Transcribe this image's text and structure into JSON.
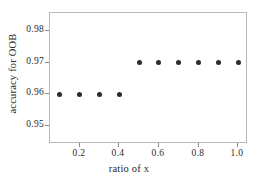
{
  "chart_data": {
    "type": "scatter",
    "title": "",
    "xlabel": "ratio of x",
    "ylabel": "accuracy for OOB",
    "xlim": [
      0.05,
      1.05
    ],
    "ylim": [
      0.9445,
      0.9855
    ],
    "grid": false,
    "legend": null,
    "marker": {
      "shape": "circle",
      "color": "#2b2b2b",
      "size": 5
    },
    "x": [
      0.1,
      0.2,
      0.3,
      0.4,
      0.5,
      0.6,
      0.7,
      0.8,
      0.9,
      1.0
    ],
    "values": [
      0.96,
      0.96,
      0.96,
      0.96,
      0.97,
      0.97,
      0.97,
      0.97,
      0.97,
      0.97
    ],
    "xticks": [
      0.2,
      0.4,
      0.6,
      0.8,
      1.0
    ],
    "xticklabels": [
      "0.2",
      "0.4",
      "0.6",
      "0.8",
      "1.0"
    ],
    "yticks": [
      0.95,
      0.96,
      0.97,
      0.98
    ],
    "yticklabels": [
      "0.95",
      "0.96",
      "0.97",
      "0.98"
    ]
  },
  "figure": {
    "background_color": "#ffffff",
    "frame_color": "#b9b9b9",
    "tick_color": "#8a8a8a",
    "text_color": "#2b2b2b"
  }
}
